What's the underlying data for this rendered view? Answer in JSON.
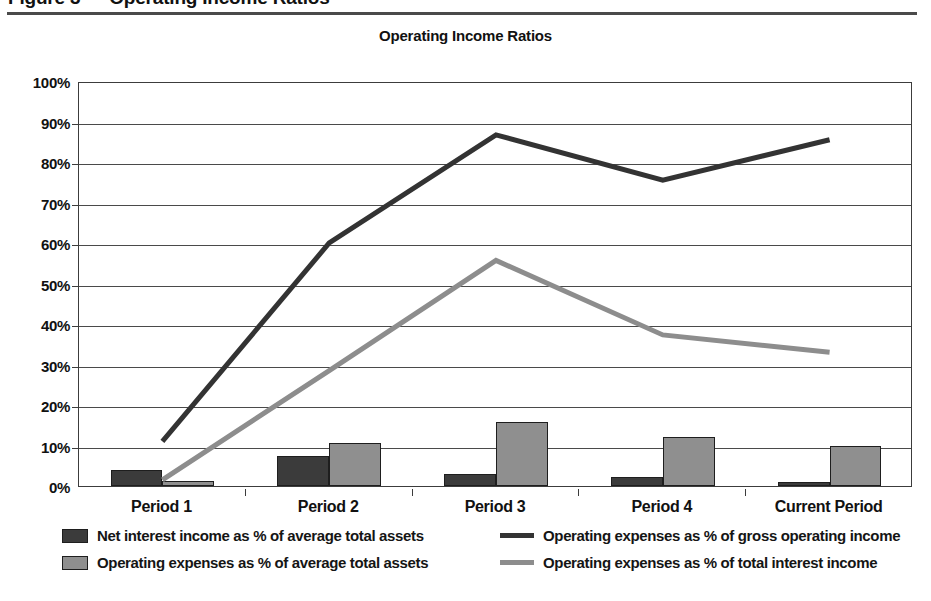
{
  "page": {
    "top_heading": "Figure 3 — Operating Income Ratios",
    "title": "Operating Income Ratios"
  },
  "chart_data": {
    "type": "bar",
    "title": "Operating Income Ratios",
    "xlabel": "",
    "ylabel": "",
    "ylim": [
      0,
      100
    ],
    "grid": true,
    "legend_position": "bottom",
    "categories": [
      "Period 1",
      "Period 2",
      "Period 3",
      "Period 4",
      "Current Period"
    ],
    "ytick_labels": [
      "100%",
      "90%",
      "80%",
      "70%",
      "60%",
      "50%",
      "40%",
      "30%",
      "20%",
      "10%",
      "0%"
    ],
    "ytick_values": [
      100,
      90,
      80,
      70,
      60,
      50,
      40,
      30,
      20,
      10,
      0
    ],
    "series": [
      {
        "name": "Net interest income as % of average total assets",
        "kind": "bar",
        "color": "#3b3b3b",
        "values": [
          4.0,
          7.5,
          3.0,
          2.2,
          1.0
        ]
      },
      {
        "name": "Operating expenses as % of average total assets",
        "kind": "bar",
        "color": "#8f8f8f",
        "values": [
          1.2,
          10.5,
          15.7,
          12.0,
          10.0
        ]
      },
      {
        "name": "Operating expenses as % of gross operating income",
        "kind": "line",
        "color": "#333333",
        "values": [
          11.5,
          60.5,
          87.2,
          76.0,
          86.0
        ]
      },
      {
        "name": "Operating expenses as % of total interest income",
        "kind": "line",
        "color": "#8d8d8d",
        "values": [
          2.0,
          29.0,
          56.2,
          37.8,
          33.5
        ]
      }
    ]
  }
}
